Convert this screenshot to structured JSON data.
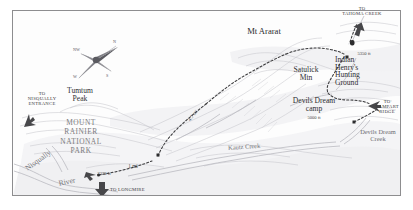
{
  "map": {
    "title_visible": false,
    "colors": {
      "frame": "#8d8d8f",
      "paper": "#fdfdfd",
      "terrain_line": "#b9b9bd",
      "terrain_fill": "#ededf0",
      "river": "#bfbfc6",
      "trail": "#3a3a3c",
      "label": "#2f2f31",
      "park_label": "#7b7b7d",
      "arrow": "#4a4a4d"
    },
    "peaks": [
      {
        "name": "Mt Ararat",
        "x": 262,
        "y": 32
      },
      {
        "name": "Satulick\nMtn",
        "x": 305,
        "y": 74
      },
      {
        "name": "Tumtum\nPeak",
        "x": 78,
        "y": 94
      }
    ],
    "places": [
      {
        "name": "Indian\nHenry's\nHunting\nGround",
        "x": 355,
        "y": 69
      },
      {
        "name": "Devils Dream\ncamp",
        "x": 313,
        "y": 104,
        "elevation": "5000 ft"
      }
    ],
    "park_label": "MOUNT\nRAINIER\nNATIONAL\nPARK",
    "elevations": [
      {
        "value": "5350 ft",
        "x": 363,
        "y": 55
      },
      {
        "value": "2378 ft",
        "x": 104,
        "y": 175
      },
      {
        "value": "5000 ft",
        "x": 313,
        "y": 119
      }
    ],
    "directional_labels": [
      {
        "label": "TO\nTAHOMA CREEK",
        "x": 361,
        "y": 16
      },
      {
        "label": "TO\nRAMPART\nRIDGE",
        "x": 385,
        "y": 112
      },
      {
        "label": "TO\nNISQUALLY\nENTRANCE",
        "x": 41,
        "y": 100
      },
      {
        "label": "TO LONGMIRE",
        "x": 126,
        "y": 191
      }
    ],
    "water_features": [
      {
        "name": "Nisqually",
        "x": 36,
        "y": 172,
        "rotation": -36
      },
      {
        "name": "River",
        "x": 70,
        "y": 184,
        "rotation": -14
      },
      {
        "name": "Kautz Creek",
        "x": 250,
        "y": 148,
        "rotation": -4
      },
      {
        "name": "Devils Dream\nCreek",
        "x": 377,
        "y": 136
      }
    ],
    "trail_distances": [
      {
        "value": "4.7 mi",
        "x": 192,
        "y": 117,
        "rotation": -52
      },
      {
        "value": "1 mi",
        "x": 132,
        "y": 167
      }
    ],
    "compass": {
      "center_x": 96,
      "center_y": 60,
      "labels": [
        {
          "dir": "N",
          "x": 117,
          "y": 45
        },
        {
          "dir": "NW",
          "x": 79,
          "y": 52
        },
        {
          "dir": "W",
          "x": 78,
          "y": 77
        },
        {
          "dir": "S",
          "x": 110,
          "y": 76
        },
        {
          "dir": "E",
          "x": 117,
          "y": 45
        }
      ]
    },
    "trail_markers": [
      {
        "name": "trailhead-marker",
        "x": 98,
        "y": 175
      },
      {
        "name": "junction-marker",
        "x": 158,
        "y": 155
      },
      {
        "name": "summit-marker",
        "x": 347,
        "y": 57
      },
      {
        "name": "pass-marker",
        "x": 352,
        "y": 43
      },
      {
        "name": "creek-marker",
        "x": 354,
        "y": 122
      }
    ]
  }
}
